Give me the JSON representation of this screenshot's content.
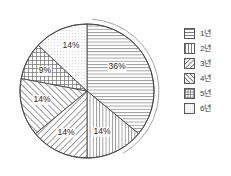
{
  "chart_data": {
    "type": "pie",
    "title": "",
    "subtitle": "",
    "xlabel": "",
    "ylabel": "",
    "grid": false,
    "legend_position": "right",
    "units": "%",
    "categories": [
      "1년",
      "2년",
      "3년",
      "4년",
      "5년",
      "6년"
    ],
    "values": [
      36,
      14,
      14,
      14,
      9,
      14
    ],
    "labels": [
      "36%",
      "14%",
      "14%",
      "14%",
      "9%",
      "14%"
    ],
    "patterns": [
      "horizontal-lines",
      "vertical-lines",
      "diagonal-lines-forward",
      "diagonal-lines-back",
      "crosshatch",
      "fine-dots"
    ],
    "start_angle_deg": 0,
    "direction": "clockwise",
    "slices": [
      {
        "category": "1년",
        "value": 36,
        "label": "36%",
        "pattern": "horizontal-lines",
        "start_deg": 0,
        "end_deg": 129.6,
        "label_x": 117,
        "label_y": 69
      },
      {
        "category": "2년",
        "value": 14,
        "label": "14%",
        "pattern": "vertical-lines",
        "start_deg": 129.6,
        "end_deg": 180.0,
        "label_x": 102,
        "label_y": 134
      },
      {
        "category": "3년",
        "value": 14,
        "label": "14%",
        "pattern": "diagonal-lines-forward",
        "start_deg": 180.0,
        "end_deg": 230.4,
        "label_x": 66,
        "label_y": 135
      },
      {
        "category": "4년",
        "value": 14,
        "label": "14%",
        "pattern": "diagonal-lines-back",
        "start_deg": 230.4,
        "end_deg": 280.8,
        "label_x": 42,
        "label_y": 102
      },
      {
        "category": "5년",
        "value": 9,
        "label": "9%",
        "pattern": "crosshatch",
        "start_deg": 280.8,
        "end_deg": 313.2,
        "label_x": 45,
        "label_y": 73
      },
      {
        "category": "6년",
        "value": 14,
        "label": "14%",
        "pattern": "fine-dots",
        "start_deg": 313.2,
        "end_deg": 360.0,
        "label_x": 71,
        "label_y": 48
      }
    ]
  },
  "legend": {
    "items": [
      {
        "label": "1년",
        "pattern": "horizontal-lines"
      },
      {
        "label": "2년",
        "pattern": "vertical-lines"
      },
      {
        "label": "3년",
        "pattern": "diagonal-lines-forward"
      },
      {
        "label": "4년",
        "pattern": "diagonal-lines-back"
      },
      {
        "label": "5년",
        "pattern": "crosshatch"
      },
      {
        "label": "6년",
        "pattern": "fine-dots"
      }
    ]
  },
  "colors": {
    "stroke": "#4a4a4a",
    "hatch": "#6e6e6e",
    "text": "#2b2b2b",
    "background": "#ffffff"
  }
}
